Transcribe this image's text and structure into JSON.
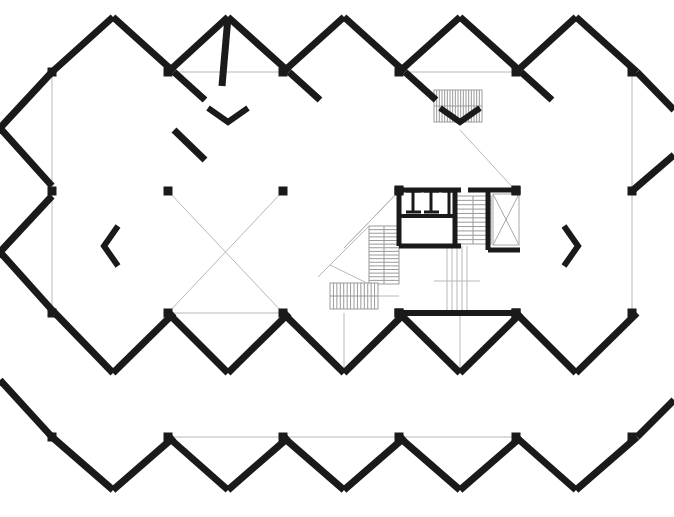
{
  "document": {
    "type": "architectural-floor-plan",
    "title": "",
    "canvas": {
      "width": 674,
      "height": 517,
      "background": "#ffffff"
    }
  },
  "style": {
    "wall_color": "#1a1a1a",
    "thin_line_color": "#b8b8b8",
    "stair_line_color": "#9a9a9a",
    "shaft_line_color": "#a8a8a8",
    "wall_thickness": 7,
    "thin_thickness": 1,
    "column_size": 9
  },
  "geometry": {
    "comment_not_rendered": "values below are the actual drawn coordinates",
    "diamond_grid": {
      "apex_top_y": 17,
      "valley_top_y": 72,
      "mid_y": 191,
      "valley_mid_y": 313,
      "apex_low_y": 373,
      "apex_bottom_y": 490,
      "column_xs": [
        52,
        168,
        283,
        399,
        516,
        632
      ],
      "apex_xs": [
        113,
        228,
        344,
        460,
        576
      ]
    }
  },
  "walls": {
    "thick_segments": [
      {
        "name": "top-apex-1-left",
        "x1": 52,
        "y1": 72,
        "x2": 113,
        "y2": 17
      },
      {
        "name": "top-apex-1-right",
        "x1": 113,
        "y1": 17,
        "x2": 174,
        "y2": 72
      },
      {
        "name": "top-valley-1-down-left",
        "x1": 174,
        "y1": 72,
        "x2": 205,
        "y2": 100
      },
      {
        "name": "top-apex-2-left",
        "x1": 222,
        "y1": 86,
        "x2": 228,
        "y2": 17
      },
      {
        "name": "top-apex-2-left-b",
        "x1": 168,
        "y1": 72,
        "x2": 228,
        "y2": 17
      },
      {
        "name": "top-apex-2-right",
        "x1": 228,
        "y1": 17,
        "x2": 289,
        "y2": 72
      },
      {
        "name": "top-valley-2-down",
        "x1": 289,
        "y1": 72,
        "x2": 320,
        "y2": 100
      },
      {
        "name": "top-apex-3-left",
        "x1": 283,
        "y1": 72,
        "x2": 344,
        "y2": 17
      },
      {
        "name": "top-apex-3-right",
        "x1": 344,
        "y1": 17,
        "x2": 405,
        "y2": 72
      },
      {
        "name": "top-valley-3-down",
        "x1": 405,
        "y1": 72,
        "x2": 436,
        "y2": 100
      },
      {
        "name": "top-apex-4-left",
        "x1": 399,
        "y1": 72,
        "x2": 460,
        "y2": 17
      },
      {
        "name": "top-apex-4-right",
        "x1": 460,
        "y1": 17,
        "x2": 521,
        "y2": 72
      },
      {
        "name": "top-valley-4-down",
        "x1": 521,
        "y1": 72,
        "x2": 552,
        "y2": 100
      },
      {
        "name": "top-apex-5-left",
        "x1": 516,
        "y1": 72,
        "x2": 576,
        "y2": 17
      },
      {
        "name": "top-apex-5-right",
        "x1": 576,
        "y1": 17,
        "x2": 637,
        "y2": 72
      },
      {
        "name": "left-upper-edge",
        "x1": 52,
        "y1": 72,
        "x2": 0,
        "y2": 128
      },
      {
        "name": "left-upper-to-mid",
        "x1": 0,
        "y1": 128,
        "x2": 52,
        "y2": 186
      },
      {
        "name": "right-upper-edge",
        "x1": 637,
        "y1": 72,
        "x2": 674,
        "y2": 110
      },
      {
        "name": "right-upper-to-mid",
        "x1": 674,
        "y1": 155,
        "x2": 632,
        "y2": 191
      },
      {
        "name": "mid-valley-2-up",
        "x1": 205,
        "y1": 160,
        "x2": 174,
        "y2": 130
      },
      {
        "name": "lower-left-diag",
        "x1": 52,
        "y1": 196,
        "x2": 0,
        "y2": 252
      },
      {
        "name": "lower-left-diag-2",
        "x1": 0,
        "y1": 252,
        "x2": 52,
        "y2": 310
      },
      {
        "name": "bottom-apex-1-left",
        "x1": 52,
        "y1": 310,
        "x2": 113,
        "y2": 373
      },
      {
        "name": "bottom-apex-1-right",
        "x1": 113,
        "y1": 373,
        "x2": 174,
        "y2": 313
      },
      {
        "name": "bottom-apex-2",
        "x1": 228,
        "y1": 373,
        "x2": 289,
        "y2": 313
      },
      {
        "name": "bottom-valley-1",
        "x1": 168,
        "y1": 313,
        "x2": 228,
        "y2": 373
      },
      {
        "name": "bottom-apex-3",
        "x1": 344,
        "y1": 373,
        "x2": 405,
        "y2": 313
      },
      {
        "name": "bottom-valley-2",
        "x1": 283,
        "y1": 313,
        "x2": 344,
        "y2": 373
      },
      {
        "name": "bottom-apex-4",
        "x1": 460,
        "y1": 373,
        "x2": 521,
        "y2": 313
      },
      {
        "name": "bottom-valley-3",
        "x1": 399,
        "y1": 313,
        "x2": 460,
        "y2": 373
      },
      {
        "name": "bottom-apex-5",
        "x1": 576,
        "y1": 373,
        "x2": 637,
        "y2": 313
      },
      {
        "name": "bottom-valley-4",
        "x1": 516,
        "y1": 313,
        "x2": 576,
        "y2": 373
      },
      {
        "name": "bot-left-v1",
        "x1": 52,
        "y1": 437,
        "x2": 113,
        "y2": 490
      },
      {
        "name": "bot-left-v1b",
        "x1": 113,
        "y1": 490,
        "x2": 174,
        "y2": 437
      },
      {
        "name": "bot-v2",
        "x1": 168,
        "y1": 437,
        "x2": 228,
        "y2": 490
      },
      {
        "name": "bot-v2b",
        "x1": 228,
        "y1": 490,
        "x2": 289,
        "y2": 437
      },
      {
        "name": "bot-v3",
        "x1": 283,
        "y1": 437,
        "x2": 344,
        "y2": 490
      },
      {
        "name": "bot-v3b",
        "x1": 344,
        "y1": 490,
        "x2": 405,
        "y2": 437
      },
      {
        "name": "bot-v4",
        "x1": 399,
        "y1": 437,
        "x2": 460,
        "y2": 490
      },
      {
        "name": "bot-v4b",
        "x1": 460,
        "y1": 490,
        "x2": 521,
        "y2": 437
      },
      {
        "name": "bot-v5",
        "x1": 516,
        "y1": 437,
        "x2": 576,
        "y2": 490
      },
      {
        "name": "bot-v5b",
        "x1": 576,
        "y1": 490,
        "x2": 637,
        "y2": 437
      },
      {
        "name": "bottom-left-edge",
        "x1": 0,
        "y1": 380,
        "x2": 52,
        "y2": 437
      },
      {
        "name": "bottom-right-edge",
        "x1": 637,
        "y1": 437,
        "x2": 674,
        "y2": 400
      }
    ]
  },
  "columns": [
    {
      "name": "col-a1",
      "x": 52,
      "y": 72
    },
    {
      "name": "col-a2",
      "x": 168,
      "y": 72
    },
    {
      "name": "col-a3",
      "x": 283,
      "y": 72
    },
    {
      "name": "col-a4",
      "x": 399,
      "y": 72
    },
    {
      "name": "col-a5",
      "x": 516,
      "y": 72
    },
    {
      "name": "col-a6",
      "x": 632,
      "y": 72
    },
    {
      "name": "col-b1",
      "x": 52,
      "y": 191
    },
    {
      "name": "col-b2",
      "x": 168,
      "y": 191
    },
    {
      "name": "col-b3",
      "x": 283,
      "y": 191
    },
    {
      "name": "col-b4",
      "x": 399,
      "y": 191
    },
    {
      "name": "col-b5",
      "x": 516,
      "y": 191
    },
    {
      "name": "col-b6",
      "x": 632,
      "y": 191
    },
    {
      "name": "col-c1",
      "x": 52,
      "y": 313
    },
    {
      "name": "col-c2",
      "x": 168,
      "y": 313
    },
    {
      "name": "col-c3",
      "x": 283,
      "y": 313
    },
    {
      "name": "col-c4",
      "x": 399,
      "y": 313
    },
    {
      "name": "col-c5",
      "x": 516,
      "y": 313
    },
    {
      "name": "col-c6",
      "x": 632,
      "y": 313
    },
    {
      "name": "col-d1",
      "x": 52,
      "y": 437
    },
    {
      "name": "col-d2",
      "x": 168,
      "y": 437
    },
    {
      "name": "col-d3",
      "x": 283,
      "y": 437
    },
    {
      "name": "col-d4",
      "x": 399,
      "y": 437
    },
    {
      "name": "col-d5",
      "x": 516,
      "y": 437
    },
    {
      "name": "col-d6",
      "x": 632,
      "y": 437
    }
  ],
  "thin_lines": {
    "grid_horizontals": [
      {
        "name": "grid-h-top-1",
        "x1": 168,
        "y1": 72,
        "x2": 283,
        "y2": 72
      },
      {
        "name": "grid-h-top-2",
        "x1": 399,
        "y1": 72,
        "x2": 516,
        "y2": 72
      },
      {
        "name": "grid-h-bot-1",
        "x1": 168,
        "y1": 313,
        "x2": 283,
        "y2": 313
      },
      {
        "name": "grid-h-bot-2",
        "x1": 399,
        "y1": 313,
        "x2": 516,
        "y2": 313
      },
      {
        "name": "grid-h-d-1",
        "x1": 168,
        "y1": 437,
        "x2": 283,
        "y2": 437
      },
      {
        "name": "grid-h-d-2",
        "x1": 283,
        "y1": 437,
        "x2": 399,
        "y2": 437
      },
      {
        "name": "grid-h-d-3",
        "x1": 399,
        "y1": 437,
        "x2": 516,
        "y2": 437
      }
    ],
    "grid_verticals": [
      {
        "name": "grid-v-left-a",
        "x1": 52,
        "y1": 72,
        "x2": 52,
        "y2": 191
      },
      {
        "name": "grid-v-right-a",
        "x1": 632,
        "y1": 72,
        "x2": 632,
        "y2": 191
      },
      {
        "name": "grid-v-left-b",
        "x1": 52,
        "y1": 191,
        "x2": 52,
        "y2": 313
      },
      {
        "name": "grid-v-right-b",
        "x1": 632,
        "y1": 191,
        "x2": 632,
        "y2": 313
      },
      {
        "name": "grid-v-core",
        "x1": 460,
        "y1": 313,
        "x2": 460,
        "y2": 373
      },
      {
        "name": "grid-v-core-2",
        "x1": 344,
        "y1": 313,
        "x2": 344,
        "y2": 373
      }
    ],
    "grid_diagonals": [
      {
        "name": "grid-diag-1",
        "x1": 168,
        "y1": 191,
        "x2": 283,
        "y2": 313
      },
      {
        "name": "grid-diag-2",
        "x1": 283,
        "y1": 191,
        "x2": 168,
        "y2": 313
      },
      {
        "name": "grid-diag-3",
        "x1": 283,
        "y1": 313,
        "x2": 344,
        "y2": 373
      },
      {
        "name": "grid-diag-4",
        "x1": 399,
        "y1": 191,
        "x2": 344,
        "y2": 248
      },
      {
        "name": "grid-diag-5",
        "x1": 460,
        "y1": 130,
        "x2": 516,
        "y2": 191
      },
      {
        "name": "grid-diag-6",
        "x1": 344,
        "y1": 248,
        "x2": 399,
        "y2": 191
      },
      {
        "name": "grid-diag-7",
        "x1": 228,
        "y1": 373,
        "x2": 283,
        "y2": 318
      },
      {
        "name": "grid-diag-8",
        "x1": 283,
        "y1": 318,
        "x2": 344,
        "y2": 373
      }
    ]
  },
  "chevron_markers": [
    {
      "name": "chevron-v-top",
      "x": 228,
      "y": 122,
      "orientation": "down"
    },
    {
      "name": "chevron-v-top-2",
      "x": 460,
      "y": 122,
      "orientation": "down"
    },
    {
      "name": "chevron-left-mid",
      "x": 104,
      "y": 246,
      "orientation": "right"
    },
    {
      "name": "chevron-right-mid",
      "x": 578,
      "y": 246,
      "orientation": "left"
    }
  ],
  "core": {
    "name": "service-core",
    "bounds": {
      "x": 396,
      "y": 186,
      "width": 124,
      "height": 130
    },
    "rooms": [
      {
        "name": "toilet-room",
        "x": 399,
        "y": 190,
        "width": 62,
        "height": 56
      },
      {
        "name": "stair-enclosure",
        "x": 455,
        "y": 190,
        "width": 40,
        "height": 56
      },
      {
        "name": "elevator-shaft",
        "x": 492,
        "y": 193,
        "width": 28,
        "height": 53
      }
    ],
    "toilet_partitions": [
      {
        "name": "partition-1",
        "x": 413,
        "y": 190,
        "height": 22
      },
      {
        "name": "partition-2",
        "x": 431,
        "y": 190,
        "height": 22
      },
      {
        "name": "partition-3",
        "x": 449,
        "y": 190,
        "height": 28
      }
    ],
    "partition_caps": [
      {
        "name": "cap-1",
        "x1": 406,
        "y1": 191,
        "x2": 421,
        "y2": 191
      },
      {
        "name": "cap-2",
        "x1": 424,
        "y1": 191,
        "x2": 439,
        "y2": 191
      },
      {
        "name": "cap-3",
        "x1": 442,
        "y1": 191,
        "x2": 457,
        "y2": 191
      },
      {
        "name": "cap-4",
        "x1": 406,
        "y1": 212,
        "x2": 421,
        "y2": 212
      },
      {
        "name": "cap-5",
        "x1": 424,
        "y1": 212,
        "x2": 439,
        "y2": 212
      }
    ]
  },
  "stairs": [
    {
      "name": "stair-top-entry",
      "run_direction": "vertical",
      "x": 434,
      "y": 90,
      "width": 48,
      "height": 32,
      "tread_count": 18,
      "tread_orientation": "vertical"
    },
    {
      "name": "stair-core-main",
      "run_direction": "horizontal",
      "x": 455,
      "y": 196,
      "width": 36,
      "height": 48,
      "tread_count": 11,
      "tread_orientation": "horizontal"
    },
    {
      "name": "stair-lower-left-a",
      "run_direction": "vertical",
      "x": 369,
      "y": 226,
      "width": 30,
      "height": 58,
      "tread_count": 16,
      "tread_orientation": "horizontal"
    },
    {
      "name": "stair-lower-left-b",
      "run_direction": "horizontal",
      "x": 330,
      "y": 283,
      "width": 48,
      "height": 26,
      "tread_count": 14,
      "tread_orientation": "vertical"
    }
  ],
  "shaft_hatch": {
    "name": "elevator-x-bracing",
    "x": 493,
    "y": 194,
    "width": 26,
    "height": 51
  },
  "core_drop_lines": {
    "name": "core-vertical-guides",
    "x_positions": [
      447,
      452,
      457,
      462,
      467
    ],
    "y1": 246,
    "y2": 316
  },
  "bottom_core_wall": {
    "name": "core-bottom-wall",
    "x1": 399,
    "y1": 313,
    "x2": 516,
    "y2": 313
  }
}
